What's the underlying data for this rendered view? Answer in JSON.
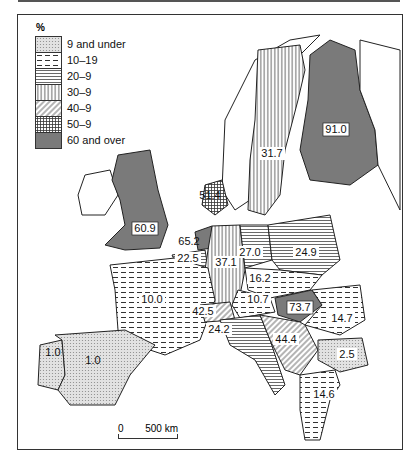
{
  "legend": {
    "unit": "%",
    "classes": [
      {
        "label": "9 and under",
        "pattern": "dots"
      },
      {
        "label": "10–19",
        "pattern": "dashes"
      },
      {
        "label": "20–9",
        "pattern": "hlines"
      },
      {
        "label": "30–9",
        "pattern": "vlines"
      },
      {
        "label": "40–9",
        "pattern": "diag"
      },
      {
        "label": "50–9",
        "pattern": "grid"
      },
      {
        "label": "60 and over",
        "pattern": "solid"
      }
    ]
  },
  "regions": [
    {
      "name": "Finland",
      "value": "91.0",
      "class": "60 and over"
    },
    {
      "name": "Sweden",
      "value": "31.7",
      "class": "30–9"
    },
    {
      "name": "Denmark",
      "value": "51.4",
      "class": "50–9"
    },
    {
      "name": "United Kingdom",
      "value": "60.9",
      "class": "60 and over"
    },
    {
      "name": "Netherlands",
      "value": "65.2",
      "class": "60 and over"
    },
    {
      "name": "Belgium",
      "value": "22.5",
      "class": "20–9"
    },
    {
      "name": "West Germany",
      "value": "37.1",
      "class": "30–9"
    },
    {
      "name": "East Germany",
      "value": "27.0",
      "class": "20–9"
    },
    {
      "name": "Poland",
      "value": "24.9",
      "class": "20–9"
    },
    {
      "name": "Czechoslovakia",
      "value": "16.2",
      "class": "10–19"
    },
    {
      "name": "Austria",
      "value": "10.7",
      "class": "10–19"
    },
    {
      "name": "Hungary",
      "value": "73.7",
      "class": "60 and over"
    },
    {
      "name": "Romania",
      "value": "14.7",
      "class": "10–19"
    },
    {
      "name": "France",
      "value": "10.0",
      "class": "10–19"
    },
    {
      "name": "Switzerland",
      "value": "42.5",
      "class": "40–9"
    },
    {
      "name": "Italy",
      "value": "24.2",
      "class": "20–9"
    },
    {
      "name": "Yugoslavia",
      "value": "44.4",
      "class": "40–9"
    },
    {
      "name": "Bulgaria",
      "value": "2.5",
      "class": "9 and under"
    },
    {
      "name": "Greece",
      "value": "14.6",
      "class": "10–19"
    },
    {
      "name": "Portugal",
      "value": "1.0",
      "class": "9 and under"
    },
    {
      "name": "Spain",
      "value": "1.0",
      "class": "9 and under"
    }
  ],
  "scale": {
    "start": "0",
    "end": "500 km"
  }
}
